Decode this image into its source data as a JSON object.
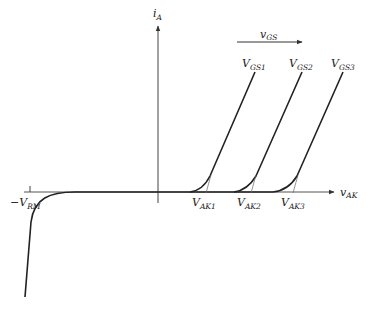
{
  "diagram": {
    "axes": {
      "y_label": {
        "main": "i",
        "sub": "A"
      },
      "x_label": {
        "main": "v",
        "sub": "AK"
      }
    },
    "gate_arrow_label": {
      "main": "v",
      "sub": "GS"
    },
    "reverse_label": {
      "main": "−V",
      "sub": "RM"
    },
    "curves": [
      {
        "label_main": "V",
        "label_sub": "GS1",
        "vak_main": "V",
        "vak_sub": "AK1"
      },
      {
        "label_main": "V",
        "label_sub": "GS2",
        "vak_main": "V",
        "vak_sub": "AK2"
      },
      {
        "label_main": "V",
        "label_sub": "GS3",
        "vak_main": "V",
        "vak_sub": "AK3"
      }
    ],
    "colors": {
      "line": "#222222",
      "axis": "#444444",
      "background": "#ffffff"
    }
  }
}
